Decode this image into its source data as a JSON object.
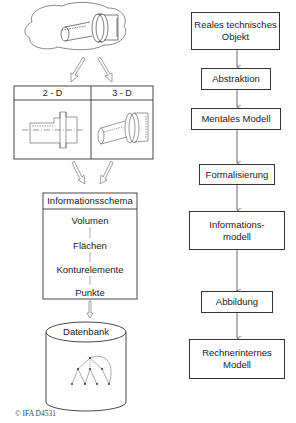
{
  "left_flow": {
    "object_illustration": "technical-part-shaft",
    "table": {
      "columns": [
        "2 - D",
        "3 - D"
      ],
      "cells": [
        "2d-drawing-shaft",
        "3d-model-shaft"
      ]
    },
    "schema": {
      "title": "Informationsschema",
      "levels": [
        "Volumen",
        "Flächen",
        "Konturelemente",
        "Punkte"
      ]
    },
    "database": {
      "label": "Datenbank",
      "graphic": "tree-graph"
    }
  },
  "right_flow": {
    "steps": [
      {
        "label": "Reales technisches\nObjekt",
        "type": "state"
      },
      {
        "label": "Abstraktion",
        "type": "process"
      },
      {
        "label": "Mentales Modell",
        "type": "state"
      },
      {
        "label": "Formalisierung",
        "type": "process"
      },
      {
        "label": "Informations-\nmodell",
        "type": "state"
      },
      {
        "label": "Abbildung",
        "type": "process"
      },
      {
        "label": "Rechnerinternes\nModell",
        "type": "state"
      }
    ]
  },
  "footer": {
    "copyright": "© IFA D4531"
  },
  "colors": {
    "line": "#333333",
    "arrow_outline": "#666666",
    "background": "#ffffff"
  }
}
